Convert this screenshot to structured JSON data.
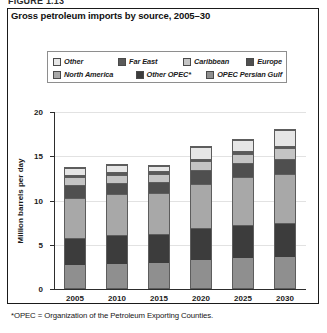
{
  "figure_caption": "FIGURE 1.13",
  "footnote": "*OPEC = Organization of the Petroleum Exporting Counties.",
  "chart_data": {
    "type": "bar",
    "subtype": "stacked",
    "title": "Gross petroleum imports by source, 2005–30",
    "xlabel": "",
    "ylabel": "Million barrels per day",
    "categories": [
      "2005",
      "2010",
      "2015",
      "2020",
      "2025",
      "2030"
    ],
    "ylim": [
      0,
      20
    ],
    "yticks": [
      0,
      5,
      10,
      15,
      20
    ],
    "grid": true,
    "legend_position": "top",
    "series": [
      {
        "name": "OPEC Persian Gulf",
        "color": "#8f8f8f",
        "values": [
          2.6,
          2.7,
          2.8,
          3.2,
          3.4,
          3.5
        ]
      },
      {
        "name": "Other OPEC*",
        "color": "#3c3c3c",
        "values": [
          3.1,
          3.3,
          3.3,
          3.6,
          3.7,
          3.8
        ]
      },
      {
        "name": "North America",
        "color": "#a8a8a8",
        "values": [
          4.5,
          4.6,
          4.6,
          5.0,
          5.4,
          5.6
        ]
      },
      {
        "name": "Europe",
        "color": "#4f4f4f",
        "values": [
          1.4,
          1.3,
          1.3,
          1.5,
          1.6,
          1.7
        ]
      },
      {
        "name": "Caribbean",
        "color": "#c4c4c4",
        "values": [
          0.9,
          0.9,
          0.9,
          1.0,
          1.1,
          1.2
        ]
      },
      {
        "name": "Far East",
        "color": "#5a5a5a",
        "values": [
          0.3,
          0.3,
          0.3,
          0.3,
          0.3,
          0.3
        ]
      },
      {
        "name": "Other",
        "color": "#e6e6e6",
        "values": [
          0.8,
          0.8,
          0.6,
          1.3,
          1.2,
          1.8
        ]
      }
    ],
    "totals": [
      13.6,
      13.9,
      13.8,
      15.9,
      16.7,
      17.9
    ],
    "legend_order": [
      "Other",
      "Far East",
      "Caribbean",
      "Europe",
      "North America",
      "Other OPEC*",
      "OPEC Persian Gulf"
    ]
  }
}
